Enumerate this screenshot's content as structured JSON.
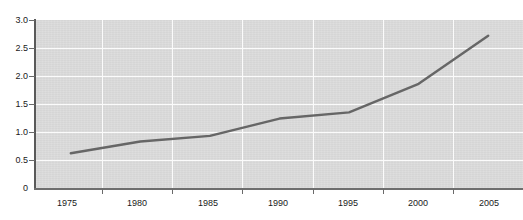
{
  "chart_data": {
    "type": "line",
    "title": "",
    "subtitle": "",
    "xlabel": "",
    "ylabel": "",
    "x": [
      1975,
      1980,
      1985,
      1990,
      1995,
      2000,
      2005
    ],
    "series": [
      {
        "name": "series-1",
        "values": [
          0.62,
          0.83,
          0.93,
          1.24,
          1.35,
          1.86,
          2.72
        ],
        "color": "#666666"
      }
    ],
    "xtick_labels": [
      "1975",
      "1980",
      "1985",
      "1990",
      "1995",
      "2000",
      "2005"
    ],
    "ytick_labels": [
      "3.0",
      "2.5",
      "2.0",
      "1.5",
      "1.0",
      "0.5",
      "0"
    ],
    "ytick_values": [
      3.0,
      2.5,
      2.0,
      1.5,
      1.0,
      0.5,
      0
    ],
    "xlim": [
      1972.5,
      2007.5
    ],
    "ylim": [
      0,
      3.0
    ],
    "grid": true,
    "grid_color": "#fbfbfb",
    "plot_background": "#dcdcdc",
    "axis_color": "#5a5a5a",
    "legend": null,
    "legend_position": "none",
    "annotations": []
  },
  "axes": {
    "y_ticks": [
      {
        "label": "3.0",
        "value": 3.0
      },
      {
        "label": "2.5",
        "value": 2.5
      },
      {
        "label": "2.0",
        "value": 2.0
      },
      {
        "label": "1.5",
        "value": 1.5
      },
      {
        "label": "1.0",
        "value": 1.0
      },
      {
        "label": "0.5",
        "value": 0.5
      },
      {
        "label": "0",
        "value": 0
      }
    ],
    "x_ticks": [
      {
        "label": "1975",
        "value": 1975
      },
      {
        "label": "1980",
        "value": 1980
      },
      {
        "label": "1985",
        "value": 1985
      },
      {
        "label": "1990",
        "value": 1990
      },
      {
        "label": "1995",
        "value": 1995
      },
      {
        "label": "2000",
        "value": 2000
      },
      {
        "label": "2005",
        "value": 2005
      }
    ]
  }
}
